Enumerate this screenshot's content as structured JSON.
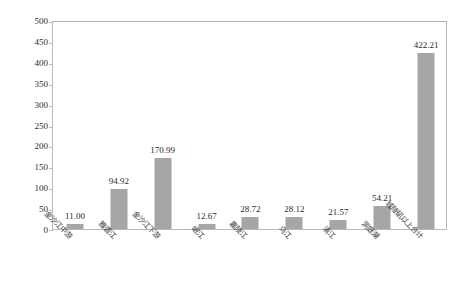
{
  "chart_data": {
    "type": "bar",
    "title": "",
    "xlabel": "",
    "ylabel": "剩余可用库容(亿m³)",
    "ylim": [
      0,
      500
    ],
    "ytick_step": 50,
    "yticks": [
      500,
      450,
      400,
      350,
      300,
      250,
      200,
      150,
      100,
      50,
      0
    ],
    "grid": false,
    "legend": "none",
    "bar_color": "#a6a6a6",
    "categories": [
      "金沙江中游",
      "雅砻江",
      "金沙江下游",
      "岷江",
      "嘉陵江",
      "乌江",
      "清江",
      "洞庭湖",
      "城陵矶以上合计"
    ],
    "values": [
      11.0,
      94.92,
      170.99,
      12.67,
      28.72,
      28.12,
      21.57,
      54.21,
      422.21
    ],
    "value_labels": [
      "11.00",
      "94.92",
      "170.99",
      "12.67",
      "28.72",
      "28.12",
      "21.57",
      "54.21",
      "422.21"
    ]
  },
  "axes": {
    "frame_color": "#b9b9b9",
    "tick_label_color": "#2e2e2e"
  }
}
